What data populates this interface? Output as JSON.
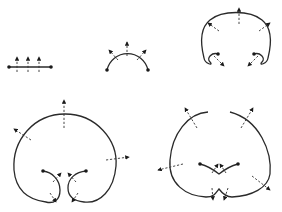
{
  "diagram": {
    "type": "curve-evolution-with-normals",
    "colors": {
      "background": "#ffffff",
      "stroke": "#2a2a2a"
    },
    "panels": [
      {
        "id": "segment",
        "description": "straight segment with three upward normal arrows",
        "endpoints": 2,
        "normals": 3
      },
      {
        "id": "arc",
        "description": "semicircular arc with three outward normal arrows",
        "endpoints": 2,
        "normals": 3
      },
      {
        "id": "curled-arc",
        "description": "arc with ends curled inward, five normal arrows",
        "endpoints": 2,
        "normals": 5
      },
      {
        "id": "heart-loop",
        "description": "large loop with inward spiral ends, six normal arrows",
        "endpoints": 2,
        "normals": 6
      },
      {
        "id": "heart-cusp",
        "description": "heart-shaped closed curve with cusp, eight normal arrows",
        "endpoints": 2,
        "normals": 8
      }
    ]
  }
}
